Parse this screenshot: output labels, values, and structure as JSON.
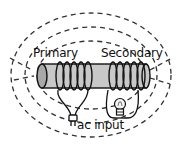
{
  "diagram": {
    "labels": {
      "primary": "Primary",
      "secondary": "Secondary",
      "input": "ac input"
    },
    "components": [
      {
        "id": "core",
        "kind": "iron-core-cylinder",
        "color": "#c8c8c8"
      },
      {
        "id": "primary-coil",
        "kind": "coil",
        "turns": 5,
        "side": "left"
      },
      {
        "id": "secondary-coil",
        "kind": "coil",
        "turns": 5,
        "side": "right"
      },
      {
        "id": "plug",
        "kind": "ac-plug",
        "connected_to": "primary-coil"
      },
      {
        "id": "bulb",
        "kind": "lightbulb",
        "connected_to": "secondary-coil"
      },
      {
        "id": "field-lines",
        "kind": "dashed-magnetic-field-loops",
        "count": 6
      }
    ],
    "colors": {
      "line": "#111111",
      "core_fill": "#c8c8c8",
      "core_end": "#a8a8a8",
      "field": "#333333",
      "background": "#ffffff"
    }
  }
}
